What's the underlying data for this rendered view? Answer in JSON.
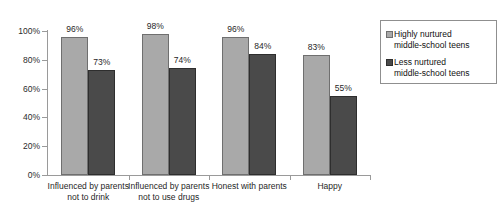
{
  "chart_data": {
    "type": "bar",
    "title": "",
    "xlabel": "",
    "ylabel": "",
    "ylim": [
      0,
      100
    ],
    "grid": false,
    "legend_position": "right",
    "categories": [
      "Influenced by parents\nnot to drink",
      "Influenced by parents\nnot to use drugs",
      "Honest with parents",
      "Happy"
    ],
    "ytick_labels": [
      "100%",
      "80%",
      "60%",
      "40%",
      "20%",
      "0%"
    ],
    "ytick_values": [
      100,
      80,
      60,
      40,
      20,
      0
    ],
    "series": [
      {
        "name": "Highly nurtured\nmiddle-school teens",
        "color": "#a9a9a9",
        "values": [
          96,
          98,
          96,
          83
        ],
        "value_labels": [
          "96%",
          "98%",
          "96%",
          "83%"
        ]
      },
      {
        "name": "Less nurtured\nmiddle-school teens",
        "color": "#4a4a4a",
        "values": [
          73,
          74,
          84,
          55
        ],
        "value_labels": [
          "73%",
          "74%",
          "84%",
          "55%"
        ]
      }
    ]
  },
  "legend": {
    "items": [
      {
        "label": "Highly nurtured\nmiddle-school teens",
        "color": "#a9a9a9"
      },
      {
        "label": "Less nurtured\nmiddle-school teens",
        "color": "#4a4a4a"
      }
    ]
  }
}
